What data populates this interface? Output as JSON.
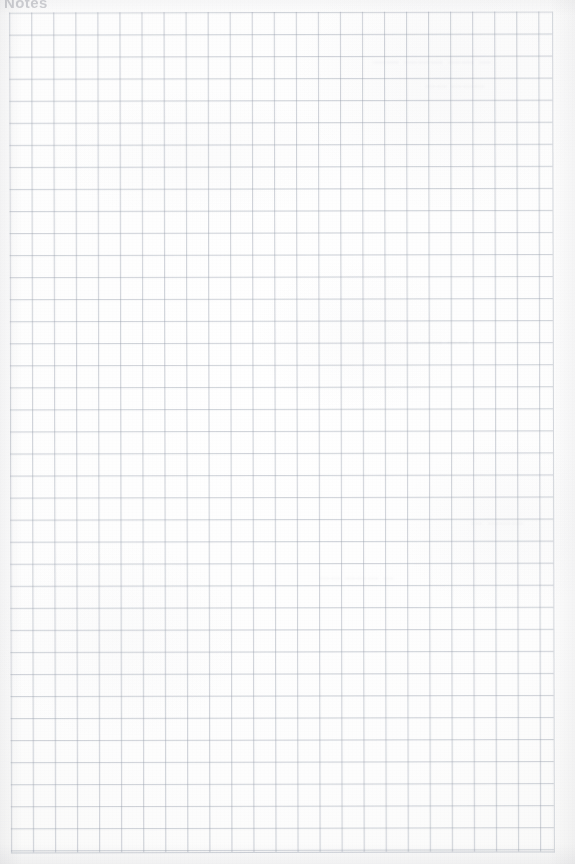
{
  "page": {
    "kind": "scanned-graph-paper",
    "width": 575,
    "height": 864,
    "background_color": "#fdfdfc"
  },
  "header": {
    "text": "Notes",
    "note": "faint, cropped at the top edge of the scan"
  },
  "grid": {
    "line_color": "#969eac",
    "cell_size_px": 22,
    "columns": 24,
    "rows": 38,
    "left_px": 10,
    "top_px": 12,
    "width_px": 543,
    "height_px": 840
  },
  "bleed_through": [
    {
      "id": "bleed-1",
      "text": "— —— ——— ——"
    },
    {
      "id": "bleed-2",
      "text": "——— ——"
    },
    {
      "id": "bleed-3",
      "text": "——— —"
    },
    {
      "id": "bleed-4",
      "text": "—— ———"
    },
    {
      "id": "bleed-5",
      "text": "— ——— ——"
    }
  ]
}
